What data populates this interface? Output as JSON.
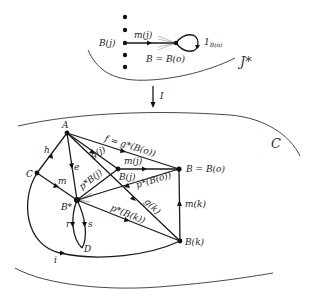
{
  "top_diagram": {
    "category_label": "J*",
    "node_source": "B(j)",
    "morphism_label": "m(j)",
    "target_label": "B = B(o)",
    "identity_label": "1",
    "identity_subscript": "B(o)",
    "dot_count": 5
  },
  "functor": {
    "label": "I"
  },
  "bottom_diagram": {
    "category_label": "C",
    "nodes": {
      "A": "A",
      "C": "C",
      "Bstar": "B*",
      "Bj": "B(j)",
      "Bo": "B = B(o)",
      "Bk": "B(k)",
      "D": "D"
    },
    "edges": {
      "f": "f = g*(B(o))",
      "gj": "g(j)",
      "gk": "g(k)",
      "mj": "m(j)",
      "mk": "m(k)",
      "h": "h",
      "e": "e",
      "m": "m",
      "i": "i",
      "r": "r",
      "s": "s",
      "pBj": "p*B(j)",
      "pBo": "p*(B(o))",
      "pBk": "p*(B(k))"
    }
  }
}
